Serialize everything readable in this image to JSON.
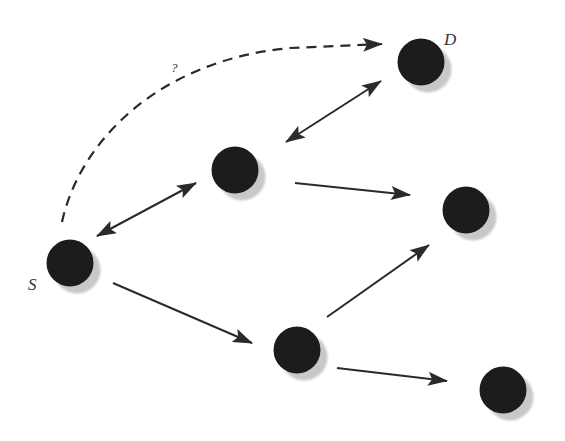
{
  "diagram": {
    "type": "network-graph",
    "width": 565,
    "height": 441,
    "colors": {
      "background": "#ffffff",
      "node_fill": "#1c1c1c",
      "node_shadow": "#c8c8c8",
      "edge": "#2a2a2a",
      "label": "#333333"
    },
    "node_radius": 23.5,
    "shadow_offset": [
      7,
      7
    ],
    "nodes": [
      {
        "id": "S",
        "label": "S",
        "x": 70,
        "y": 263,
        "label_x": 28,
        "label_y": 290
      },
      {
        "id": "A",
        "label": "",
        "x": 235,
        "y": 170
      },
      {
        "id": "D",
        "label": "D",
        "x": 421,
        "y": 62,
        "label_x": 444,
        "label_y": 45
      },
      {
        "id": "B",
        "label": "",
        "x": 466,
        "y": 210
      },
      {
        "id": "C",
        "label": "",
        "x": 297,
        "y": 350
      },
      {
        "id": "E",
        "label": "",
        "x": 503,
        "y": 390
      }
    ],
    "edges": [
      {
        "from": "S",
        "to": "A",
        "directed": "both",
        "x1": 97,
        "y1": 236,
        "x2": 196,
        "y2": 183
      },
      {
        "from": "A",
        "to": "D",
        "directed": "both",
        "x1": 286,
        "y1": 142,
        "x2": 381,
        "y2": 81
      },
      {
        "from": "A",
        "to": "B",
        "directed": "forward",
        "x1": 295,
        "y1": 183,
        "x2": 410,
        "y2": 195
      },
      {
        "from": "S",
        "to": "C",
        "directed": "forward",
        "x1": 113,
        "y1": 283,
        "x2": 252,
        "y2": 343
      },
      {
        "from": "C",
        "to": "B",
        "directed": "forward",
        "x1": 327,
        "y1": 317,
        "x2": 429,
        "y2": 245
      },
      {
        "from": "C",
        "to": "E",
        "directed": "forward",
        "x1": 337,
        "y1": 368,
        "x2": 447,
        "y2": 381
      }
    ],
    "unknown_route": {
      "from": "S",
      "to": "D",
      "style": "dashed",
      "label": "?",
      "label_x": 171,
      "label_y": 72,
      "path": "M 62 222 C 80 140, 160 60, 290 48 L 382 44"
    }
  }
}
